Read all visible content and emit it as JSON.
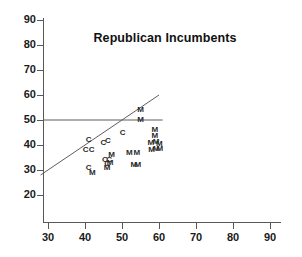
{
  "chart_data": {
    "type": "scatter",
    "title": "Republican Incumbents",
    "xlabel": "",
    "ylabel": "",
    "xlim": [
      25,
      92
    ],
    "ylim": [
      16,
      92
    ],
    "xticks": [
      30,
      40,
      50,
      60,
      70,
      80,
      90
    ],
    "yticks": [
      20,
      30,
      40,
      50,
      60,
      70,
      80,
      90
    ],
    "grid": false,
    "legend": false,
    "marker_style": "text-label",
    "series": [
      {
        "name": "C",
        "label": "C",
        "points": [
          {
            "x": 41.0,
            "y": 42.0
          },
          {
            "x": 40.2,
            "y": 38.2
          },
          {
            "x": 41.8,
            "y": 38.0
          },
          {
            "x": 45.0,
            "y": 41.0
          },
          {
            "x": 46.2,
            "y": 41.6
          },
          {
            "x": 41.0,
            "y": 31.0
          },
          {
            "x": 45.4,
            "y": 34.0
          },
          {
            "x": 46.5,
            "y": 34.2
          },
          {
            "x": 46.0,
            "y": 32.4
          },
          {
            "x": 50.2,
            "y": 45.0
          }
        ]
      },
      {
        "name": "M",
        "label": "M",
        "points": [
          {
            "x": 42.0,
            "y": 29.0
          },
          {
            "x": 46.0,
            "y": 30.8
          },
          {
            "x": 47.2,
            "y": 36.2
          },
          {
            "x": 46.8,
            "y": 33.0
          },
          {
            "x": 52.0,
            "y": 37.0
          },
          {
            "x": 54.0,
            "y": 37.0
          },
          {
            "x": 55.0,
            "y": 54.0
          },
          {
            "x": 55.0,
            "y": 50.0
          },
          {
            "x": 53.2,
            "y": 32.0
          },
          {
            "x": 54.3,
            "y": 32.2
          },
          {
            "x": 58.9,
            "y": 46.2
          },
          {
            "x": 58.9,
            "y": 43.8
          },
          {
            "x": 57.8,
            "y": 41.0
          },
          {
            "x": 59.2,
            "y": 41.4
          },
          {
            "x": 60.1,
            "y": 40.4
          },
          {
            "x": 58.0,
            "y": 38.0
          },
          {
            "x": 59.2,
            "y": 38.4
          },
          {
            "x": 60.2,
            "y": 38.6
          }
        ]
      }
    ],
    "reference_lines": [
      {
        "name": "horizontal-50-line",
        "orientation": "horizontal",
        "y": 50,
        "x_start": 28,
        "x_end": 61
      },
      {
        "name": "identity-diagonal-line",
        "orientation": "diagonal",
        "x_start": 28,
        "y_start": 28,
        "x_end": 60,
        "y_end": 60
      }
    ]
  }
}
